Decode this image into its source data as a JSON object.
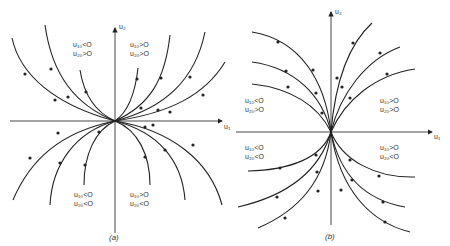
{
  "figure": {
    "panels": [
      {
        "id": "a",
        "caption": "(a)",
        "axes": {
          "x_label": "u₁",
          "y_label": "u₂"
        },
        "quadrant_labels": {
          "top_left": [
            "u₁₀<O",
            "u₂₀>O"
          ],
          "top_right": [
            "u₁₀>O",
            "u₂₀>O"
          ],
          "bottom_left": [
            "u₁₀<O",
            "u₂₀<O"
          ],
          "bottom_right": [
            "u₁₀>O",
            "u₂₀<O"
          ]
        },
        "description": "Trajectories approach the origin tangent to the u1 axis (improper node)"
      },
      {
        "id": "b",
        "caption": "(b)",
        "axes": {
          "x_label": "u₁",
          "y_label": "u₂"
        },
        "quadrant_labels": {
          "top_left": [
            "u₁₀<O",
            "u₂₀>O"
          ],
          "top_right": [
            "u₁₀>O",
            "u₂₀>O"
          ],
          "bottom_left": [
            "u₁₀<O",
            "u₂₀<O"
          ],
          "bottom_right": [
            "u₁₀>O",
            "u₂₀<O"
          ]
        },
        "description": "Trajectories approach the origin tangent to the u2 axis (improper node)"
      }
    ],
    "colors": {
      "line": "#222222",
      "axis": "#333333",
      "background": "#ffffff"
    }
  }
}
